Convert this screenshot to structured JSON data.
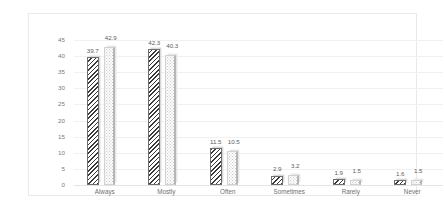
{
  "chart_data": {
    "type": "bar",
    "title": "",
    "xlabel": "",
    "ylabel": "",
    "categories": [
      "Always",
      "Mostly",
      "Often",
      "Sometimes",
      "Rarely",
      "Never"
    ],
    "series": [
      {
        "name": "series-1",
        "pattern": "diagonal-hatch",
        "values": [
          39.7,
          42.3,
          11.5,
          2.9,
          1.9,
          1.6
        ]
      },
      {
        "name": "series-2",
        "pattern": "light-dotted",
        "values": [
          42.9,
          40.3,
          10.5,
          3.2,
          1.5,
          1.5
        ]
      }
    ],
    "ylim": [
      0,
      45
    ],
    "ytick_step": 5,
    "yticks": [
      "0",
      "5",
      "10",
      "15",
      "20",
      "25",
      "30",
      "35",
      "40",
      "45"
    ],
    "grid": true,
    "legend": "none",
    "data_labels": true,
    "colors": {
      "series1_stroke": "#3a3a3a",
      "series2_fill": "#fdfdfd",
      "gridline": "#f0f0f0",
      "frame_border": "#e9e9e9",
      "tick_text": "#7b7b7b",
      "label_text": "#5d5d5d"
    }
  }
}
